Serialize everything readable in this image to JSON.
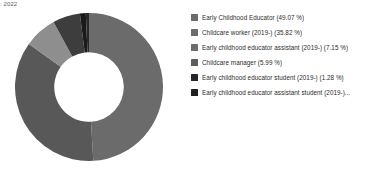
{
  "caption": ": 2022",
  "colors": {
    "background": "#ffffff",
    "text": "#2b2b2b",
    "caption": "#5c5c5c"
  },
  "chart_data": {
    "type": "pie",
    "variant": "donut",
    "title": "",
    "xlabel": "",
    "ylabel": "",
    "grid": false,
    "legend_position": "right",
    "units": "%",
    "start_angle_deg": 0,
    "direction": "clockwise",
    "inner_radius_ratio": 0.47,
    "categories": [
      "Early Childhood Educator",
      "Childcare worker (2019-)",
      "Early childhood educator assistant (2019-)",
      "Childcare manager",
      "Early childhood educator student (2019-)",
      "Early childhood educator assistant student (2019-)"
    ],
    "values": [
      49.07,
      35.82,
      7.15,
      5.99,
      1.28,
      0.69
    ],
    "slice_colors": [
      "#6b6b6b",
      "#585858",
      "#8e8e8e",
      "#3d3d3d",
      "#1a1a1a",
      "#2a2a2a"
    ]
  },
  "legend": {
    "items": [
      {
        "label": "Early Childhood Educator (49.07 %)",
        "color": "#6b6b6b"
      },
      {
        "label": "Childcare worker (2019-) (35.82 %)",
        "color": "#6b6b6b"
      },
      {
        "label": "Early childhood educator assistant (2019-) (7.15 %)",
        "color": "#6e6e6e"
      },
      {
        "label": "Childcare manager (5.99 %)",
        "color": "#5e5e5e"
      },
      {
        "label": "Early childhood educator student (2019-) (1.28 %)",
        "color": "#262626"
      },
      {
        "label": "Early childhood educator assistant student (2019-)...",
        "color": "#1f1f1f"
      }
    ]
  }
}
